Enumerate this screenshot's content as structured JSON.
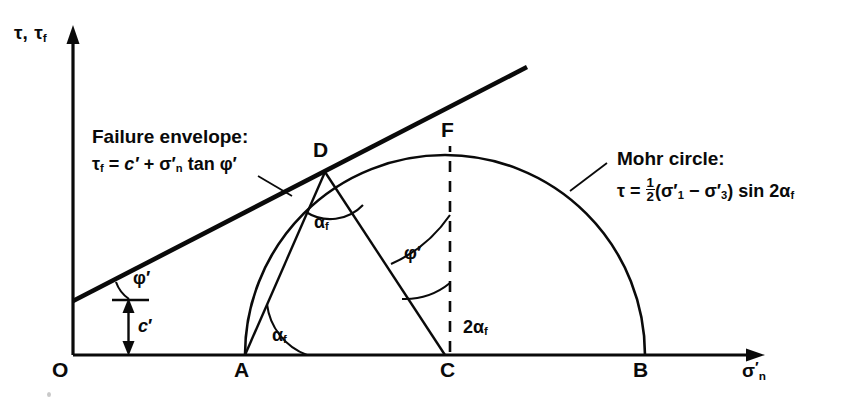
{
  "figure": {
    "kind": "mohr-circle-failure-envelope",
    "background": "#ffffff",
    "ink": "#0a0a0a"
  },
  "axes": {
    "y_label": "τ, τf",
    "y_label_main": "τ,",
    "y_label_sub_base": "τ",
    "y_label_sub": "f",
    "x_label_base": "σ",
    "x_label_prime": "′",
    "x_label_sub": "n",
    "origin_label": "O"
  },
  "points": [
    {
      "name": "O",
      "label": "O",
      "x": 73,
      "y": 355
    },
    {
      "name": "A",
      "label": "A",
      "x": 240,
      "y": 355
    },
    {
      "name": "C",
      "label": "C",
      "x": 450,
      "y": 355
    },
    {
      "name": "B",
      "label": "B",
      "x": 640,
      "y": 355
    },
    {
      "name": "D",
      "label": "D",
      "x": 325,
      "y": 172
    },
    {
      "name": "F",
      "label": "F",
      "x": 450,
      "y": 140
    }
  ],
  "annotations": {
    "envelope": {
      "title": "Failure envelope:",
      "equation_parts": {
        "tau_f": "τf",
        "equals": "=",
        "c_prime": "c′",
        "plus": "+",
        "sigma_n_prime": "σ′n",
        "tan": "tan",
        "phi_prime": "φ′"
      },
      "equation_plain": "τf = c′ + σ′n tan φ′"
    },
    "mohr": {
      "title": "Mohr circle:",
      "equation_parts": {
        "tau": "τ",
        "equals": "=",
        "half_num": "1",
        "half_den": "2",
        "open": "(",
        "sigma_1_prime": "σ′1",
        "minus": "−",
        "sigma_3_prime": "σ′3",
        "close": ")",
        "sin": "sin",
        "two_alpha_f": "2αf"
      },
      "equation_plain": "τ = ½ (σ′1 − σ′3) sin 2αf"
    }
  },
  "angle_labels": [
    {
      "name": "phi-prime-at-origin",
      "base": "φ",
      "prime": "′",
      "sub": "",
      "x": 133,
      "y": 270
    },
    {
      "name": "c-prime-dimension",
      "base": "c",
      "prime": "′",
      "sub": "",
      "x": 137,
      "y": 318
    },
    {
      "name": "alpha-f-at-D",
      "base": "α",
      "prime": "",
      "sub": "f",
      "x": 320,
      "y": 215
    },
    {
      "name": "alpha-f-at-A",
      "base": "α",
      "prime": "",
      "sub": "f",
      "x": 278,
      "y": 330
    },
    {
      "name": "phi-prime-at-C",
      "base": "φ",
      "prime": "′",
      "sub": "",
      "x": 408,
      "y": 251
    },
    {
      "name": "two-alpha-f-at-C",
      "base": "2α",
      "prime": "",
      "sub": "f",
      "x": 470,
      "y": 325
    }
  ],
  "geometry": {
    "y_axis_x": 73,
    "axis_y": 355,
    "y_axis_top": 28,
    "x_axis_right": 762,
    "circle_center_x": 445,
    "circle_radius": 200,
    "envelope_start": {
      "x": 73,
      "y": 300
    },
    "envelope_end": {
      "x": 527,
      "y": 67
    },
    "c_prime_x": 128,
    "c_prime_top": 300,
    "dashed_line_x": 450
  }
}
